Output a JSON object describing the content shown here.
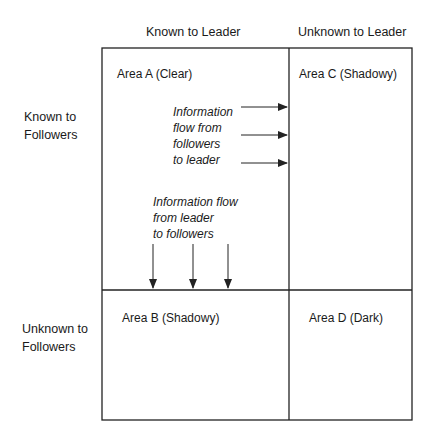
{
  "diagram": {
    "type": "johari-window-2x2",
    "columns": [
      {
        "label": "Known to Leader"
      },
      {
        "label": "Unknown to Leader"
      }
    ],
    "rows": [
      {
        "label_line1": "Known to",
        "label_line2": "Followers"
      },
      {
        "label_line1": "Unknown to",
        "label_line2": "Followers"
      }
    ],
    "cells": {
      "a": {
        "label": "Area A (Clear)"
      },
      "b": {
        "label": "Area B (Shadowy)"
      },
      "c": {
        "label": "Area C (Shadowy)"
      },
      "d": {
        "label": "Area D (Dark)"
      }
    },
    "flow_to_leader": {
      "lines": [
        "Information",
        "flow from",
        "followers",
        "to leader"
      ],
      "arrow_count": 3,
      "direction": "right"
    },
    "flow_to_followers": {
      "lines": [
        "Information flow",
        "from leader",
        "to followers"
      ],
      "arrow_count": 3,
      "direction": "down"
    },
    "colors": {
      "line": "#222222",
      "text": "#1a1a1a",
      "background": "#ffffff"
    }
  }
}
